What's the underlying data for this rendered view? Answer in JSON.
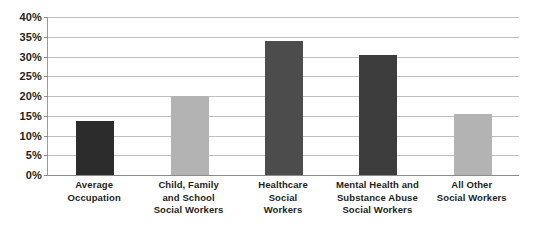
{
  "chart_data": {
    "type": "bar",
    "title": "",
    "subtitle": "",
    "xlabel": "",
    "ylabel": "",
    "ylim": [
      0,
      40
    ],
    "ytick_step": 5,
    "grid": true,
    "legend": "none",
    "value_unit": "%",
    "categories": [
      "Average Occupation",
      "Child, Family and School Social Workers",
      "Healthcare Social Workers",
      "Mental Health and Substance Abuse Social Workers",
      "All Other Social Workers"
    ],
    "values": [
      13.8,
      20.0,
      34.0,
      30.5,
      15.5
    ],
    "bar_colors": [
      "#2c2c2c",
      "#b3b3b3",
      "#4c4c4c",
      "#3d3d3d",
      "#b3b3b3"
    ]
  },
  "axes": {
    "y_ticks": [
      {
        "label": "40%",
        "value": 40
      },
      {
        "label": "35%",
        "value": 35
      },
      {
        "label": "30%",
        "value": 30
      },
      {
        "label": "25%",
        "value": 25
      },
      {
        "label": "20%",
        "value": 20
      },
      {
        "label": "15%",
        "value": 15
      },
      {
        "label": "10%",
        "value": 10
      },
      {
        "label": "5%",
        "value": 5
      },
      {
        "label": "0%",
        "value": 0
      }
    ],
    "x_categories": [
      {
        "lines": [
          "Average",
          "Occupation"
        ]
      },
      {
        "lines": [
          "Child, Family",
          "and School",
          "Social Workers"
        ]
      },
      {
        "lines": [
          "Healthcare",
          "Social",
          "Workers"
        ]
      },
      {
        "lines": [
          "Mental Health and",
          "Substance Abuse",
          "Social Workers"
        ]
      },
      {
        "lines": [
          "All Other",
          "Social Workers"
        ]
      }
    ]
  },
  "style": {
    "background": "#ffffff",
    "gridline_color": "#bfbfbf",
    "axis_color": "#8a8a8a",
    "text_color": "#231f20"
  }
}
